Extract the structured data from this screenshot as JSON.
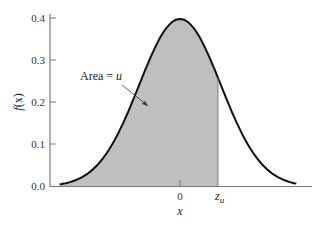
{
  "chart_data": {
    "type": "area",
    "title": "",
    "xlabel": "x",
    "ylabel": "f(x)",
    "ylim": [
      0,
      0.4
    ],
    "yticks": [
      "0.0",
      "0.1",
      "0.2",
      "0.3",
      "0.4"
    ],
    "xticks": [
      "0",
      "z_u"
    ],
    "curve": "standard normal density f(x)",
    "peak": {
      "x": 0,
      "y": 0.399
    },
    "shaded_region": {
      "from": "-inf",
      "to": "z_u",
      "z_u_approx": 0.93
    },
    "annotation": "Area = u",
    "colors": {
      "curve": "#111111",
      "fill": "#bfbfbf",
      "axis": "#777777"
    }
  },
  "labels": {
    "ylabel_f": "f",
    "ylabel_x": "(x)",
    "xlabel": "x",
    "zero": "0",
    "zu_z": "z",
    "zu_u": "u",
    "area_prefix": "Area = ",
    "area_var": "u"
  }
}
